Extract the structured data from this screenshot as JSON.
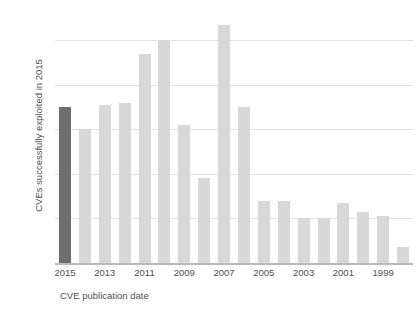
{
  "top_clip_text": "",
  "chart_data": {
    "type": "bar",
    "title": "",
    "xlabel": "CVE publication date",
    "ylabel": "CVEs successfully exploited in 2015",
    "ylim": [
      0,
      110
    ],
    "yticks": [
      0,
      20,
      40,
      60,
      80,
      100
    ],
    "ytick_labels": [
      "0",
      "20",
      "40",
      "60",
      "80",
      "100"
    ],
    "grid": "horizontal",
    "legend": "none",
    "categories": [
      "2015",
      "2014",
      "2013",
      "2012",
      "2011",
      "2010",
      "2009",
      "2008",
      "2007",
      "2006",
      "2005",
      "2004",
      "2003",
      "2002",
      "2001",
      "2000",
      "1999",
      "1998"
    ],
    "xtick_labels": [
      "2015",
      "2013",
      "2011",
      "2009",
      "2007",
      "2005",
      "2003",
      "2001",
      "1999"
    ],
    "xtick_categories": [
      "2015",
      "2013",
      "2011",
      "2009",
      "2007",
      "2005",
      "2003",
      "2001",
      "1999"
    ],
    "values": [
      70,
      60,
      71,
      72,
      94,
      100,
      62,
      38,
      107,
      70,
      28,
      28,
      20,
      20,
      27,
      23,
      21,
      7
    ],
    "highlight_index": 0,
    "colors": {
      "bar": "#d8d8d8",
      "bar_highlight": "#6e6e6e",
      "grid": "#e2e2e2",
      "axis": "#b9b9b9",
      "text": "#4f4f4f",
      "background": "#ffffff"
    }
  }
}
